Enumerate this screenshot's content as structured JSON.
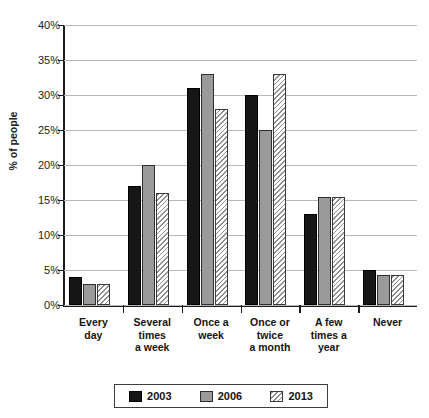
{
  "chart_data": {
    "type": "bar",
    "title": "",
    "xlabel": "",
    "ylabel": "% of people",
    "ylim": [
      0,
      40
    ],
    "ytick_step": 5,
    "ytick_labels": [
      "0%",
      "5%",
      "10%",
      "15%",
      "20%",
      "25%",
      "30%",
      "35%",
      "40%"
    ],
    "grid": true,
    "legend_position": "bottom",
    "categories": [
      "Every day",
      "Several times a week",
      "Once a week",
      "Once or twice a month",
      "A few times a year",
      "Never"
    ],
    "category_lines": [
      [
        "Every",
        "day"
      ],
      [
        "Several",
        "times",
        "a week"
      ],
      [
        "Once a",
        "week"
      ],
      [
        "Once or",
        "twice",
        "a month"
      ],
      [
        "A few",
        "times a",
        "year"
      ],
      [
        "Never"
      ]
    ],
    "series": [
      {
        "name": "2003",
        "color": "#161616",
        "fill": "solid",
        "values": [
          4,
          17,
          31,
          30,
          13,
          5
        ]
      },
      {
        "name": "2006",
        "color": "#9a9a9a",
        "fill": "solid",
        "values": [
          3,
          20,
          33,
          25,
          15.5,
          4.3
        ]
      },
      {
        "name": "2013",
        "color": "#ffffff",
        "fill": "hatched",
        "values": [
          3,
          16,
          28,
          33,
          15.5,
          4.3
        ]
      }
    ]
  },
  "legend": {
    "items": [
      {
        "label": "2003"
      },
      {
        "label": "2006"
      },
      {
        "label": "2013"
      }
    ]
  },
  "colors": {
    "series_2003": "#161616",
    "series_2006": "#9a9a9a",
    "series_2013": "#ffffff",
    "gridline": "#b9b9bd",
    "axis": "#1c1c1c"
  }
}
